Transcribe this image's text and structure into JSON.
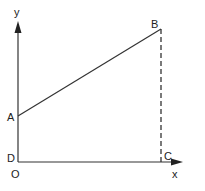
{
  "diagram": {
    "type": "coordinate-graph",
    "axes": {
      "x_label": "x",
      "y_label": "y",
      "origin_label": "O"
    },
    "points": {
      "A": {
        "label": "A"
      },
      "B": {
        "label": "B"
      },
      "C": {
        "label": "C"
      },
      "D": {
        "label": "D"
      }
    },
    "segments": [
      {
        "from": "A",
        "to": "B",
        "style": "solid"
      },
      {
        "from": "B",
        "to": "C",
        "style": "dashed"
      },
      {
        "from": "D",
        "to": "C",
        "style": "solid"
      },
      {
        "from": "D",
        "to": "A",
        "style": "solid"
      }
    ],
    "colors": {
      "stroke": "#333333",
      "text": "#222222",
      "background": "#ffffff"
    }
  }
}
